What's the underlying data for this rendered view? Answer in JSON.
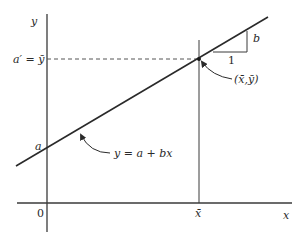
{
  "diagram": {
    "type": "regression-line-plot",
    "axes": {
      "x_label": "x",
      "y_label": "y",
      "origin_label": "0"
    },
    "points": {
      "mean_point_label": "(x̄,ȳ)",
      "intercept_label": "a",
      "y_mean_label": "a′ = ȳ",
      "x_mean_label": "x̄"
    },
    "line": {
      "equation_label": "y = a + bx"
    },
    "slope_triangle": {
      "run_label": "1",
      "rise_label": "b"
    },
    "colors": {
      "stroke": "#3a3a3a",
      "dashed": "#555555",
      "background": "#ffffff"
    }
  }
}
